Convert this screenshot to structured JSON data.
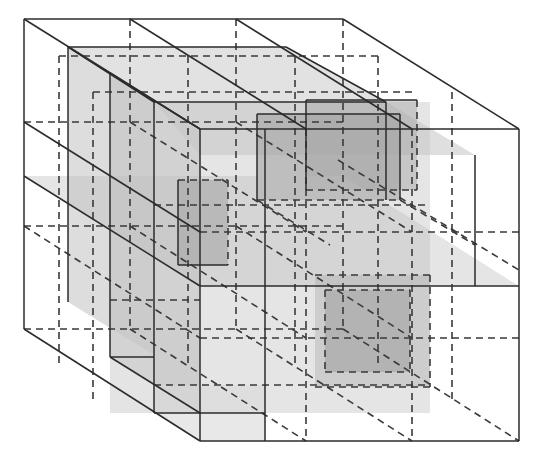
{
  "diagram": {
    "title": "",
    "colors": {
      "background": "#ffffff",
      "edge": "#2b2b2b",
      "dashed": "#3a3a3a",
      "light_fill": "#c8c8c8",
      "mid_fill": "#a8a8a8",
      "dark_fill": "#8a8a8a"
    },
    "outer_cube": {
      "back": {
        "x": 24,
        "y": 19,
        "w": 319,
        "h": 310
      },
      "front": {
        "x": 200,
        "y": 129,
        "w": 319,
        "h": 312
      }
    },
    "fills": [
      {
        "name": "left-inner-wall",
        "points": "68,47 68,302 154,355 154,102",
        "fill": "#d2d2d2",
        "opacity": 0.75
      },
      {
        "name": "mid-depth-block-left",
        "points": "110,73 110,357 200,413 200,129",
        "fill": "#bfbfbf",
        "opacity": 0.55
      },
      {
        "name": "front-top-slab",
        "points": "68,47 286,47 386,102 154,102",
        "fill": "#cfcfcf",
        "opacity": 0.6
      },
      {
        "name": "upper-right-slab",
        "points": "154,102 386,102 475,155 200,155",
        "fill": "#c4c4c4",
        "opacity": 0.55
      },
      {
        "name": "central-block",
        "points": "154,102 430,102 430,413 154,413",
        "fill": "#c6c6c6",
        "opacity": 0.45
      },
      {
        "name": "top-right-box",
        "points": "257,114 400,114 400,200 257,200",
        "fill": "#9e9e9e",
        "opacity": 0.55
      },
      {
        "name": "top-right-box-2",
        "points": "306,100 417,100 417,190 306,190",
        "fill": "#a2a2a2",
        "opacity": 0.45
      },
      {
        "name": "left-small-box",
        "points": "178,180 228,180 228,265 178,265",
        "fill": "#969696",
        "opacity": 0.6
      },
      {
        "name": "horizontal-mid-slab",
        "points": "24,176 343,176 519,286 200,286",
        "fill": "#bdbdbd",
        "opacity": 0.4
      },
      {
        "name": "bottom-right-box",
        "points": "325,290 410,290 410,372 325,372",
        "fill": "#969696",
        "opacity": 0.6
      },
      {
        "name": "bottom-right-box-2",
        "points": "315,275 430,275 430,387 315,387",
        "fill": "#b0b0b0",
        "opacity": 0.45
      },
      {
        "name": "lower-left-slab",
        "points": "110,300 200,300 200,413 110,413",
        "fill": "#c9c9c9",
        "opacity": 0.5
      },
      {
        "name": "lower-front-strip",
        "points": "154,385 265,385 265,441 200,441 154,413",
        "fill": "#d9d9d9",
        "opacity": 0.6
      }
    ],
    "solid_lines": [
      "24,19 343,19",
      "24,19 24,329",
      "343,19 519,129",
      "24,19 200,129",
      "200,129 519,129",
      "200,129 200,441",
      "519,129 519,441",
      "200,441 519,441",
      "24,329 200,441",
      "24,176 200,286",
      "200,286 519,286",
      "68,47 68,302",
      "68,47 286,47",
      "68,47 154,102",
      "154,102 154,413",
      "154,102 386,102",
      "286,47 386,102",
      "110,73 110,357",
      "110,73 200,129",
      "110,357 200,413",
      "265,129 265,441",
      "386,102 386,200",
      "475,155 475,286",
      "24,122 200,232",
      "130,19 306,129",
      "236,19 412,129",
      "257,114 400,114",
      "257,114 257,200",
      "400,114 400,200",
      "306,100 417,100",
      "306,100 306,190",
      "178,180 178,265",
      "178,265 228,265",
      "154,413 265,413",
      "110,357 154,357"
    ],
    "dashed_lines": [
      "24,329 343,329",
      "343,19 343,329",
      "343,329 519,441",
      "130,19 130,329",
      "236,19 236,329",
      "24,122 343,122",
      "24,226 343,226",
      "59,56 378,56",
      "93,92 412,92",
      "154,205 430,205",
      "200,232 519,232",
      "306,129 306,441",
      "412,129 412,441",
      "188,56 188,366",
      "295,56 295,366",
      "130,329 306,441",
      "236,329 412,441",
      "24,226 200,338",
      "130,122 306,232",
      "236,122 412,232",
      "130,226 306,338",
      "236,226 412,338",
      "110,300 200,300",
      "200,338 519,338",
      "154,385 430,385",
      "325,290 410,290",
      "325,290 325,372",
      "410,290 410,372",
      "325,372 410,372",
      "315,275 430,275",
      "315,387 430,387",
      "430,275 430,387",
      "257,200 400,200",
      "306,190 417,190",
      "417,100 417,190",
      "178,180 228,180",
      "228,180 228,265",
      "59,56 59,366",
      "93,92 93,402",
      "378,56 378,366",
      "452,92 452,402",
      "400,200 475,245",
      "257,200 330,245",
      "338,160 519,270"
    ]
  }
}
